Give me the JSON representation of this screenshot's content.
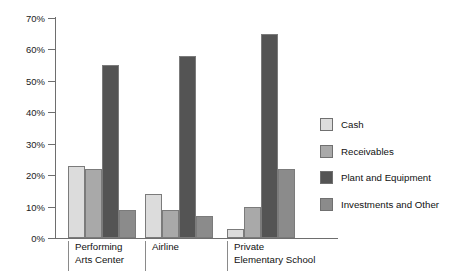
{
  "chart_data": {
    "type": "bar",
    "title": "",
    "subtitle": "",
    "xlabel": "",
    "ylabel": "",
    "ylim": [
      0,
      70
    ],
    "ytick_values": [
      0,
      10,
      20,
      30,
      40,
      50,
      60,
      70
    ],
    "ytick_labels": [
      "0%",
      "10%",
      "20%",
      "30%",
      "40%",
      "50%",
      "60%",
      "70%"
    ],
    "grid": false,
    "legend_position": "right",
    "categories": [
      "Performing\nArts Center",
      "Airline",
      "Private\nElementary School"
    ],
    "category_labels_flat": [
      "Performing Arts Center",
      "Airline",
      "Private Elementary School"
    ],
    "series": [
      {
        "name": "Cash",
        "color": "#dcdcdc",
        "values": [
          23,
          14,
          3
        ]
      },
      {
        "name": "Receivables",
        "color": "#a9a9a9",
        "values": [
          22,
          9,
          10
        ]
      },
      {
        "name": "Plant and Equipment",
        "color": "#545454",
        "values": [
          55,
          58,
          65
        ]
      },
      {
        "name": "Investments and Other",
        "color": "#8b8b8b",
        "values": [
          9,
          7,
          22
        ]
      }
    ]
  },
  "axis": {
    "y_labels": [
      "70%",
      "60%",
      "50%",
      "40%",
      "30%",
      "20%",
      "10%",
      "0%"
    ]
  },
  "legend": {
    "items": [
      {
        "label": "Cash",
        "color": "#dcdcdc"
      },
      {
        "label": "Receivables",
        "color": "#a9a9a9"
      },
      {
        "label": "Plant and Equipment",
        "color": "#545454"
      },
      {
        "label": "Investments and Other",
        "color": "#8b8b8b"
      }
    ]
  }
}
